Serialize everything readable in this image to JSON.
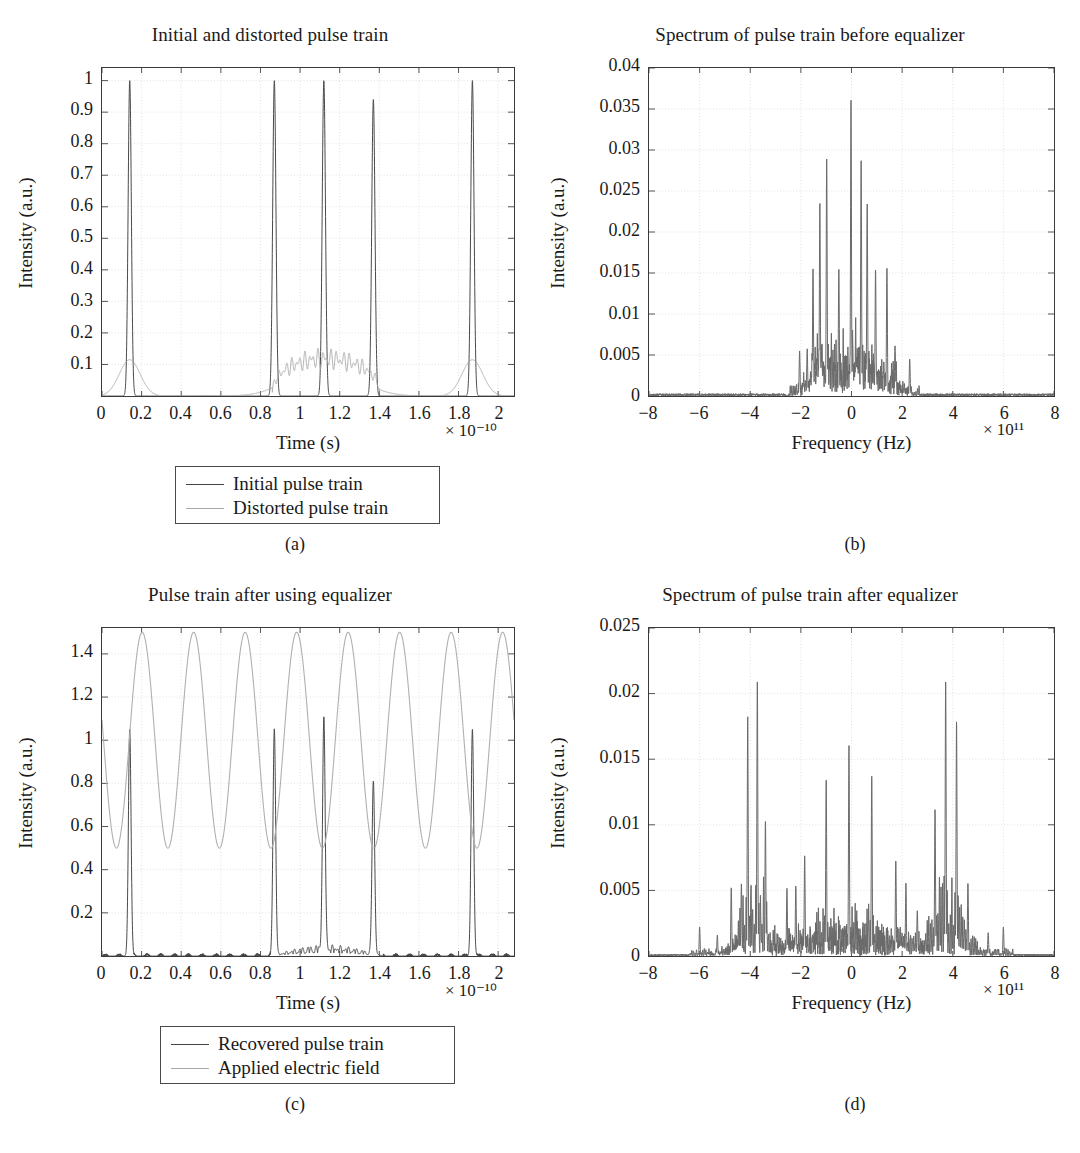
{
  "figure": {
    "panel_letters": [
      "(a)",
      "(b)",
      "(c)",
      "(d)"
    ]
  },
  "chart_data": [
    {
      "id": "a",
      "type": "line",
      "title": "Initial and distorted pulse train",
      "xlabel": "Time (s)",
      "ylabel": "Intensity (a.u.)",
      "x_exponent": "× 10⁻¹⁰",
      "y_exponent": "",
      "xlim": [
        0,
        2.08
      ],
      "ylim": [
        0,
        1.04
      ],
      "xticks": [
        "0",
        "0.2",
        "0.4",
        "0.6",
        "0.8",
        "1",
        "1.2",
        "1.4",
        "1.6",
        "1.8",
        "2"
      ],
      "xtick_values": [
        0,
        0.2,
        0.4,
        0.6,
        0.8,
        1.0,
        1.2,
        1.4,
        1.6,
        1.8,
        2.0
      ],
      "yticks": [
        "0.1",
        "0.2",
        "0.3",
        "0.4",
        "0.5",
        "0.6",
        "0.7",
        "0.8",
        "0.9",
        "1"
      ],
      "ytick_values": [
        0.1,
        0.2,
        0.3,
        0.4,
        0.5,
        0.6,
        0.7,
        0.8,
        0.9,
        1.0
      ],
      "grid": true,
      "legend_position": "below-center",
      "series": [
        {
          "name": "Initial pulse train",
          "color": "#4a4a4a",
          "kind": "pulse-train",
          "peaks": [
            {
              "center": 0.14,
              "height": 1.0,
              "width": 0.022
            },
            {
              "center": 0.87,
              "height": 1.0,
              "width": 0.022
            },
            {
              "center": 1.12,
              "height": 1.0,
              "width": 0.022
            },
            {
              "center": 1.37,
              "height": 0.94,
              "width": 0.022
            },
            {
              "center": 1.87,
              "height": 1.0,
              "width": 0.022
            }
          ]
        },
        {
          "name": "Distorted pulse train",
          "color": "#b0b0b0",
          "kind": "distorted-envelope",
          "envelopes": [
            {
              "center": 0.14,
              "height": 0.115,
              "width": 0.105,
              "ripple": false
            },
            {
              "center": 1.12,
              "height": 0.118,
              "width": 0.3,
              "ripple": true,
              "ripple_start": 0.86,
              "ripple_end": 1.4,
              "ripple_freq": 38,
              "ripple_amp": 0.035
            },
            {
              "center": 1.87,
              "height": 0.115,
              "width": 0.105,
              "ripple": false
            }
          ]
        }
      ]
    },
    {
      "id": "b",
      "type": "line",
      "title": "Spectrum of pulse train before equalizer",
      "xlabel": "Frequency (Hz)",
      "ylabel": "Intensity (a.u.)",
      "x_exponent": "× 10¹¹",
      "xlim": [
        -8,
        8
      ],
      "ylim": [
        0,
        0.04
      ],
      "xticks": [
        "−8",
        "−6",
        "−4",
        "−2",
        "0",
        "2",
        "4",
        "6",
        "8"
      ],
      "xtick_values": [
        -8,
        -6,
        -4,
        -2,
        0,
        2,
        4,
        6,
        8
      ],
      "yticks": [
        "0",
        "0.005",
        "0.01",
        "0.015",
        "0.02",
        "0.025",
        "0.03",
        "0.035",
        "0.04"
      ],
      "ytick_values": [
        0,
        0.005,
        0.01,
        0.015,
        0.02,
        0.025,
        0.03,
        0.035,
        0.04
      ],
      "grid": true,
      "series": [
        {
          "name": "spectrum-before",
          "color": "#6a6a6a",
          "kind": "comb-spectrum",
          "noise_floor_range": [
            -2.6,
            2.6
          ],
          "noise_floor_peak": 0.006,
          "peaks": [
            {
              "x": -2.05,
              "y": 0.0055
            },
            {
              "x": -1.75,
              "y": 0.0058
            },
            {
              "x": -1.52,
              "y": 0.0155
            },
            {
              "x": -1.25,
              "y": 0.0235
            },
            {
              "x": -0.98,
              "y": 0.029
            },
            {
              "x": -0.5,
              "y": 0.0155
            },
            {
              "x": -0.02,
              "y": 0.0362
            },
            {
              "x": 0.38,
              "y": 0.0288
            },
            {
              "x": 0.62,
              "y": 0.0235
            },
            {
              "x": 0.95,
              "y": 0.0155
            },
            {
              "x": 1.4,
              "y": 0.0158
            },
            {
              "x": 1.72,
              "y": 0.0062
            },
            {
              "x": 2.3,
              "y": 0.0045
            }
          ]
        }
      ]
    },
    {
      "id": "c",
      "type": "line",
      "title": "Pulse train after using equalizer",
      "xlabel": "Time (s)",
      "ylabel": "Intensity (a.u.)",
      "x_exponent": "× 10⁻¹⁰",
      "xlim": [
        0,
        2.08
      ],
      "ylim": [
        0,
        1.52
      ],
      "xticks": [
        "0",
        "0.2",
        "0.4",
        "0.6",
        "0.8",
        "1",
        "1.2",
        "1.4",
        "1.6",
        "1.8",
        "2"
      ],
      "xtick_values": [
        0,
        0.2,
        0.4,
        0.6,
        0.8,
        1.0,
        1.2,
        1.4,
        1.6,
        1.8,
        2.0
      ],
      "yticks": [
        "0.2",
        "0.4",
        "0.6",
        "0.8",
        "1",
        "1.2",
        "1.4"
      ],
      "ytick_values": [
        0.2,
        0.4,
        0.6,
        0.8,
        1.0,
        1.2,
        1.4
      ],
      "grid": true,
      "legend_position": "below-center",
      "series": [
        {
          "name": "Recovered pulse train",
          "color": "#4a4a4a",
          "kind": "pulse-train",
          "peaks": [
            {
              "center": 0.14,
              "height": 1.05,
              "width": 0.018
            },
            {
              "center": 0.87,
              "height": 1.05,
              "width": 0.018
            },
            {
              "center": 1.12,
              "height": 1.06,
              "width": 0.018
            },
            {
              "center": 1.37,
              "height": 0.8,
              "width": 0.018
            },
            {
              "center": 1.87,
              "height": 1.05,
              "width": 0.018
            }
          ],
          "noise_floor": 0.05,
          "noise_range": [
            0.85,
            1.42
          ]
        },
        {
          "name": "Applied electric field",
          "color": "#b0b0b0",
          "kind": "sinusoid",
          "min": 0.5,
          "max": 1.5,
          "periods": 8,
          "phase_offset_frac": 0.07
        }
      ]
    },
    {
      "id": "d",
      "type": "line",
      "title": "Spectrum of pulse train after equalizer",
      "xlabel": "Frequency (Hz)",
      "ylabel": "Intensity (a.u.)",
      "x_exponent": "× 10¹¹",
      "xlim": [
        -8,
        8
      ],
      "ylim": [
        0,
        0.025
      ],
      "xticks": [
        "−8",
        "−6",
        "−4",
        "−2",
        "0",
        "2",
        "4",
        "6",
        "8"
      ],
      "xtick_values": [
        -8,
        -6,
        -4,
        -2,
        0,
        2,
        4,
        6,
        8
      ],
      "yticks": [
        "0",
        "0.005",
        "0.01",
        "0.015",
        "0.02",
        "0.025"
      ],
      "ytick_values": [
        0,
        0.005,
        0.01,
        0.015,
        0.02,
        0.025
      ],
      "grid": true,
      "series": [
        {
          "name": "spectrum-after",
          "color": "#6a6a6a",
          "kind": "comb-spectrum",
          "noise_floor_range": [
            -6.3,
            6.3
          ],
          "noise_floor_peak": 0.0028,
          "peaks": [
            {
              "x": -6.0,
              "y": 0.0022
            },
            {
              "x": -5.3,
              "y": 0.0016
            },
            {
              "x": -4.75,
              "y": 0.0052
            },
            {
              "x": -4.35,
              "y": 0.0055
            },
            {
              "x": -4.1,
              "y": 0.0183
            },
            {
              "x": -3.72,
              "y": 0.0212
            },
            {
              "x": -3.4,
              "y": 0.0104
            },
            {
              "x": -2.55,
              "y": 0.0052
            },
            {
              "x": -2.2,
              "y": 0.0054
            },
            {
              "x": -1.85,
              "y": 0.0077
            },
            {
              "x": -1.0,
              "y": 0.0136
            },
            {
              "x": -0.1,
              "y": 0.0161
            },
            {
              "x": 0.8,
              "y": 0.0137
            },
            {
              "x": 1.75,
              "y": 0.0073
            },
            {
              "x": 2.15,
              "y": 0.0056
            },
            {
              "x": 2.6,
              "y": 0.0035
            },
            {
              "x": 3.3,
              "y": 0.0112
            },
            {
              "x": 3.72,
              "y": 0.0212
            },
            {
              "x": 4.15,
              "y": 0.018
            },
            {
              "x": 4.6,
              "y": 0.0056
            },
            {
              "x": 5.4,
              "y": 0.0018
            },
            {
              "x": 6.0,
              "y": 0.0022
            }
          ]
        }
      ]
    }
  ],
  "panels": {
    "a": {
      "letter": "(a)"
    },
    "b": {
      "letter": "(b)"
    },
    "c": {
      "letter": "(c)"
    },
    "d": {
      "letter": "(d)"
    }
  }
}
